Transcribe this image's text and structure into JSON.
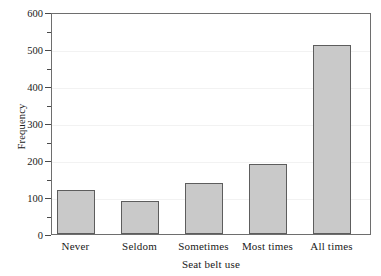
{
  "chart_data": {
    "type": "bar",
    "title": "",
    "subtitle": "",
    "xlabel": "Seat belt use",
    "ylabel": "Frequency",
    "categories": [
      "Never",
      "Seldom",
      "Sometimes",
      "Most times",
      "All times"
    ],
    "values": [
      120,
      88,
      137,
      190,
      510
    ],
    "series": [
      {
        "name": "Frequency",
        "values": [
          120,
          88,
          137,
          190,
          510
        ]
      }
    ],
    "ylim": [
      0,
      600
    ],
    "ytick_labels": [
      "0",
      "100",
      "200",
      "300",
      "400",
      "500",
      "600"
    ],
    "ytick_values": [
      0,
      100,
      200,
      300,
      400,
      500,
      600
    ],
    "yminor_tick_values": [
      50,
      150,
      250,
      350,
      450,
      550
    ],
    "ytick_interval": 100,
    "yminor_tick_interval": 50,
    "grid": "horizontal-major-faint",
    "legend": "none",
    "legend_position": "none",
    "annotations": [],
    "bar_fill_color": "#c9c9c9",
    "bar_border_color": "#5d5d5d",
    "axis_color": "#6e6e6e",
    "gridline_color": "#f2f2f2",
    "background_color": "#ffffff"
  }
}
